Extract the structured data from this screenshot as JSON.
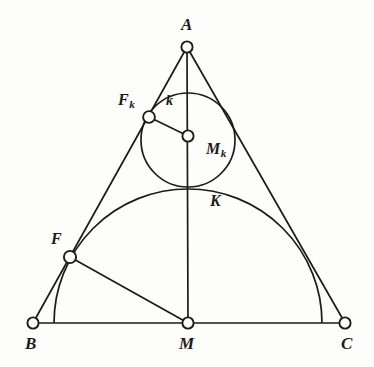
{
  "figure": {
    "background_color": "#fdfdfb",
    "ink_color": "#1b1b1b"
  },
  "labels": {
    "apex": "A",
    "bottom_left": "B",
    "bottom_right": "C",
    "base_midpoint": "M",
    "circle_k": "k",
    "circle_center": "M",
    "circle_center_sub": "k",
    "tangent_point_left": "F",
    "tangent_point_left_sub": "k",
    "foot_left": "F",
    "tangency_top": "K"
  },
  "points": {
    "A": {
      "x": 187,
      "y": 47,
      "label": "A",
      "label_x": 184,
      "label_y": 19
    },
    "B": {
      "x": 33,
      "y": 323,
      "label": "B",
      "label_x": 26,
      "label_y": 337
    },
    "C": {
      "x": 345,
      "y": 323,
      "label": "C",
      "label_x": 341,
      "label_y": 337
    },
    "M": {
      "x": 188,
      "y": 323,
      "label": "M",
      "label_x": 180,
      "label_y": 337
    },
    "Mk": {
      "x": 188,
      "y": 136,
      "label": "Mk",
      "label_x": 198,
      "label_y": 141
    },
    "Fk": {
      "x": 149,
      "y": 117,
      "label": "Fk",
      "label_x": 118,
      "label_y": 92
    },
    "F": {
      "x": 70,
      "y": 257,
      "label": "F",
      "label_x": 51,
      "label_y": 233
    },
    "K": {
      "x": 188,
      "y": 189,
      "label": "K",
      "label_x": 211,
      "label_y": 194
    },
    "k_label": {
      "label": "k",
      "label_x": 167,
      "label_y": 95
    }
  },
  "shapes": {
    "triangle": {
      "type": "polygon",
      "vertices": [
        "A",
        "B",
        "C"
      ],
      "description": "Isosceles triangle ABC"
    },
    "altitude": {
      "type": "segment",
      "from": "A",
      "to": "M",
      "description": "Vertical altitude from apex A to base midpoint M"
    },
    "base": {
      "type": "segment",
      "from": "B",
      "to": "C",
      "description": "Base BC"
    },
    "segment_FM": {
      "type": "segment",
      "from": "F",
      "to": "M",
      "description": "Segment from F to M"
    },
    "segment_FkMk": {
      "type": "segment",
      "from": "Fk",
      "to": "Mk",
      "description": "Radius of circle k to tangency point Fk"
    },
    "circle_k": {
      "type": "circle",
      "center_x": 188,
      "center_y": 140,
      "radius": 47,
      "label": "k",
      "description": "Incircle-like circle k tangent to AB, AC and the semicircle"
    },
    "semicircle": {
      "type": "arc",
      "center_x": 188,
      "center_y": 323,
      "radius": 134,
      "start_x": 54,
      "end_x": 322,
      "top_y": 189,
      "description": "Semicircle on base BC centered at M, tangent to circle k at K"
    }
  },
  "geometry_notes": {
    "tangency_K": "Circle k touches the semicircle at point K on the altitude AM",
    "tangency_Fk": "Circle k touches side AB at point Fk",
    "point_F": "F lies on side AB and on the semicircle"
  }
}
